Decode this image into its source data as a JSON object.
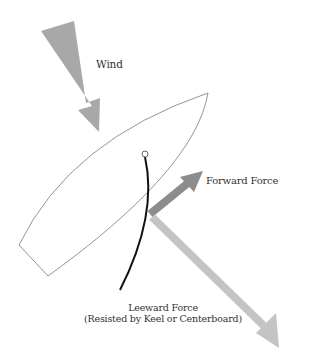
{
  "diagram": {
    "labels": {
      "wind": "Wind",
      "forward_force": "Forward Force",
      "leeward_force_line1": "Leeward Force",
      "leeward_force_line2": "(Resisted by Keel or Centerboard)"
    },
    "colors": {
      "wind_arrow": "#a8a8a8",
      "forward_arrow": "#8c8c8c",
      "leeward_arrow": "#c4c4c4",
      "hull_outline": "#888888",
      "sail_line": "#111111",
      "text": "#333333"
    },
    "elements": [
      "hull",
      "mast",
      "sail",
      "wind-arrow",
      "forward-force-arrow",
      "leeward-force-arrow"
    ]
  }
}
